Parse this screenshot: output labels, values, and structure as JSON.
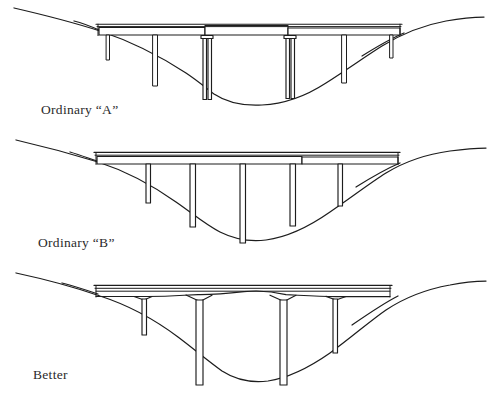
{
  "document": {
    "title": "Bridge pier and girder alternatives over a valley",
    "background_color": "#ffffff",
    "ink_color": "#1d1d1d",
    "width": 492,
    "height": 394
  },
  "panels": [
    {
      "id": "panel-a",
      "caption": "Ordinary “A”",
      "description": "Flat constant-depth deck in three separate spans with varied pier spacing and heavy twin center columns",
      "deck": {
        "left_x": 98,
        "right_x": 400,
        "top_y": 24,
        "depth": 9,
        "shape": "constant-depth straight girder",
        "segments": 3
      },
      "piers": [
        {
          "name": "pier-1",
          "x": 108,
          "width": 3,
          "top_y": 33,
          "bottom_y": 60,
          "type": "thin"
        },
        {
          "name": "pier-2",
          "x": 155,
          "width": 5,
          "top_y": 33,
          "bottom_y": 86,
          "type": "thin"
        },
        {
          "name": "pier-3",
          "x": 205,
          "width": 9,
          "top_y": 31,
          "bottom_y": 100,
          "type": "twin-capped"
        },
        {
          "name": "pier-4",
          "x": 288,
          "width": 9,
          "top_y": 31,
          "bottom_y": 100,
          "type": "twin-capped"
        },
        {
          "name": "pier-5",
          "x": 345,
          "width": 5,
          "top_y": 33,
          "bottom_y": 83,
          "type": "thin"
        },
        {
          "name": "pier-6",
          "x": 392,
          "width": 3,
          "top_y": 33,
          "bottom_y": 58,
          "type": "thin"
        }
      ],
      "terrain": {
        "left_crest_y": 8,
        "valley_floor_y": 101,
        "right_crest_y": 14,
        "profile": "steep V-shaped valley with rounded floor"
      }
    },
    {
      "id": "panel-b",
      "caption": "Ordinary “B”",
      "description": "Flat constant-depth deck on five uniform slender columns of equal spacing",
      "deck": {
        "left_x": 95,
        "right_x": 398,
        "top_y": 22,
        "depth": 9,
        "shape": "constant-depth straight girder",
        "segments": 3
      },
      "piers": [
        {
          "name": "pier-1",
          "x": 148,
          "width": 5,
          "top_y": 31,
          "bottom_y": 63,
          "type": "uniform"
        },
        {
          "name": "pier-2",
          "x": 192,
          "width": 6,
          "top_y": 31,
          "bottom_y": 141,
          "type": "uniform"
        },
        {
          "name": "pier-3",
          "x": 242,
          "width": 6,
          "top_y": 31,
          "bottom_y": 163,
          "type": "uniform"
        },
        {
          "name": "pier-4",
          "x": 292,
          "width": 6,
          "top_y": 31,
          "bottom_y": 141,
          "type": "uniform"
        },
        {
          "name": "pier-5",
          "x": 340,
          "width": 5,
          "top_y": 31,
          "bottom_y": 108,
          "type": "uniform"
        }
      ],
      "terrain": {
        "left_crest_y": 10,
        "valley_floor_y": 107,
        "right_crest_y": 14,
        "profile": "broad V-shaped valley with rounded floor"
      }
    },
    {
      "id": "panel-c",
      "caption": "Better",
      "description": "Haunched variable-depth girder with arched soffits and fewer, better proportioned piers",
      "deck": {
        "left_x": 96,
        "right_x": 390,
        "top_y": 24,
        "depth": 8,
        "shape": "haunched variable-depth girder with arched soffit",
        "segments": 1
      },
      "piers": [
        {
          "name": "pier-1",
          "x": 145,
          "width": 5,
          "top_y": 34,
          "bottom_y": 74,
          "type": "slender"
        },
        {
          "name": "pier-2",
          "x": 198,
          "width": 8,
          "top_y": 34,
          "bottom_y": 124,
          "type": "slender"
        },
        {
          "name": "pier-3",
          "x": 282,
          "width": 8,
          "top_y": 34,
          "bottom_y": 124,
          "type": "slender"
        },
        {
          "name": "pier-4",
          "x": 335,
          "width": 5,
          "top_y": 34,
          "bottom_y": 92,
          "type": "slender"
        }
      ],
      "terrain": {
        "left_crest_y": 10,
        "valley_floor_y": 123,
        "right_crest_y": 16,
        "profile": "V-shaped valley with rounded floor"
      }
    }
  ]
}
